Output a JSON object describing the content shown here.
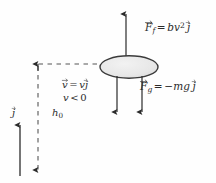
{
  "figure": {
    "background_color": "#fefefe",
    "ink_color": "#2b2b2b",
    "body": {
      "shape": "ellipse",
      "fill_color": "#e8e8e8",
      "stroke_color": "#3a3a3a",
      "center_x": 129,
      "center_y": 67,
      "radius_x": 29,
      "radius_y": 11
    },
    "labels": {
      "friction_force": {
        "name": "F_f",
        "expression": "bv^2 j",
        "text_parts": {
          "lhs_symbol": "F",
          "lhs_subscript": "f",
          "equals": "=",
          "coefficient": "b",
          "variable": "v",
          "exponent": "2",
          "unit_vector": "j"
        }
      },
      "gravity_force": {
        "name": "F_g",
        "expression": "-mg j",
        "text_parts": {
          "lhs_symbol": "F",
          "lhs_subscript": "g",
          "equals": "=",
          "rhs_prefix": "−mg",
          "unit_vector": "j"
        }
      },
      "velocity_vector": {
        "expression": "v = v j",
        "text_parts": {
          "lhs_symbol": "v",
          "equals": "=",
          "scalar": "v",
          "unit_vector": "j"
        }
      },
      "velocity_sign": {
        "expression": "v < 0",
        "text_parts": {
          "scalar": "v",
          "relation": "<",
          "value": "0"
        }
      },
      "height": {
        "name": "h_0",
        "text_parts": {
          "symbol": "h",
          "subscript": "0"
        }
      },
      "unit_vector": {
        "name": "j",
        "text_parts": {
          "symbol": "j"
        }
      }
    },
    "arrows": {
      "friction_arrow": {
        "direction": "up",
        "from_x": 126,
        "from_y": 56,
        "to_x": 126,
        "to_y": 13,
        "style": "solid"
      },
      "velocity_arrow": {
        "direction": "down",
        "from_x": 117,
        "from_y": 77,
        "to_x": 117,
        "to_y": 113,
        "style": "solid"
      },
      "gravity_arrow": {
        "direction": "down",
        "from_x": 142,
        "from_y": 77,
        "to_x": 142,
        "to_y": 113,
        "style": "solid"
      },
      "unit_vector_arrow": {
        "direction": "up",
        "from_x": 20,
        "from_y": 175,
        "to_x": 20,
        "to_y": 124,
        "style": "solid"
      },
      "height_dimension": {
        "direction": "vertical-double",
        "x": 38,
        "top_y": 64,
        "bottom_y": 172,
        "style": "dashed"
      },
      "leader_line": {
        "direction": "horizontal",
        "from_x": 38,
        "from_y": 64,
        "to_x": 102,
        "to_y": 64,
        "style": "dashed"
      }
    }
  }
}
